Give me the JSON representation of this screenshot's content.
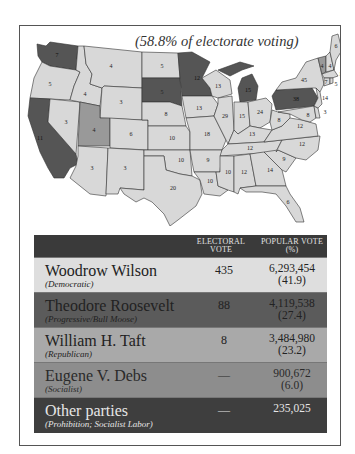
{
  "map": {
    "caption": "(58.8% of electorate voting)",
    "colors": {
      "wilson": "#d8d8d8",
      "roosevelt": "#555555",
      "taft": "#999999"
    },
    "states": [
      {
        "abbr": "WA",
        "ev": "7",
        "winner": "roosevelt"
      },
      {
        "abbr": "OR",
        "ev": "5",
        "winner": "wilson"
      },
      {
        "abbr": "CA",
        "ev": "11",
        "winner": "roosevelt"
      },
      {
        "abbr": "ID",
        "ev": "4",
        "winner": "wilson"
      },
      {
        "abbr": "NV",
        "ev": "3",
        "winner": "wilson"
      },
      {
        "abbr": "MT",
        "ev": "4",
        "winner": "wilson"
      },
      {
        "abbr": "WY",
        "ev": "3",
        "winner": "wilson"
      },
      {
        "abbr": "UT",
        "ev": "4",
        "winner": "taft"
      },
      {
        "abbr": "AZ",
        "ev": "3",
        "winner": "wilson"
      },
      {
        "abbr": "CO",
        "ev": "6",
        "winner": "wilson"
      },
      {
        "abbr": "NM",
        "ev": "3",
        "winner": "wilson"
      },
      {
        "abbr": "ND",
        "ev": "5",
        "winner": "wilson"
      },
      {
        "abbr": "SD",
        "ev": "5",
        "winner": "roosevelt"
      },
      {
        "abbr": "NE",
        "ev": "8",
        "winner": "wilson"
      },
      {
        "abbr": "KS",
        "ev": "10",
        "winner": "wilson"
      },
      {
        "abbr": "OK",
        "ev": "10",
        "winner": "wilson"
      },
      {
        "abbr": "TX",
        "ev": "20",
        "winner": "wilson"
      },
      {
        "abbr": "MN",
        "ev": "12",
        "winner": "roosevelt"
      },
      {
        "abbr": "IA",
        "ev": "13",
        "winner": "wilson"
      },
      {
        "abbr": "MO",
        "ev": "18",
        "winner": "wilson"
      },
      {
        "abbr": "AR",
        "ev": "9",
        "winner": "wilson"
      },
      {
        "abbr": "LA",
        "ev": "10",
        "winner": "wilson"
      },
      {
        "abbr": "WI",
        "ev": "13",
        "winner": "wilson"
      },
      {
        "abbr": "IL",
        "ev": "29",
        "winner": "wilson"
      },
      {
        "abbr": "MI",
        "ev": "15",
        "winner": "roosevelt"
      },
      {
        "abbr": "IN",
        "ev": "15",
        "winner": "wilson"
      },
      {
        "abbr": "OH",
        "ev": "24",
        "winner": "wilson"
      },
      {
        "abbr": "KY",
        "ev": "13",
        "winner": "wilson"
      },
      {
        "abbr": "TN",
        "ev": "12",
        "winner": "wilson"
      },
      {
        "abbr": "MS",
        "ev": "10",
        "winner": "wilson"
      },
      {
        "abbr": "AL",
        "ev": "12",
        "winner": "wilson"
      },
      {
        "abbr": "GA",
        "ev": "14",
        "winner": "wilson"
      },
      {
        "abbr": "FL",
        "ev": "6",
        "winner": "wilson"
      },
      {
        "abbr": "SC",
        "ev": "9",
        "winner": "wilson"
      },
      {
        "abbr": "NC",
        "ev": "12",
        "winner": "wilson"
      },
      {
        "abbr": "VA",
        "ev": "12",
        "winner": "wilson"
      },
      {
        "abbr": "WV",
        "ev": "8",
        "winner": "wilson"
      },
      {
        "abbr": "PA",
        "ev": "38",
        "winner": "roosevelt"
      },
      {
        "abbr": "NY",
        "ev": "45",
        "winner": "wilson"
      },
      {
        "abbr": "VT",
        "ev": "4",
        "winner": "taft"
      },
      {
        "abbr": "NH",
        "ev": "4",
        "winner": "wilson"
      },
      {
        "abbr": "ME",
        "ev": "6",
        "winner": "wilson"
      },
      {
        "abbr": "MA",
        "ev": "18",
        "winner": "wilson"
      },
      {
        "abbr": "RI",
        "ev": "5",
        "winner": "wilson"
      },
      {
        "abbr": "CT",
        "ev": "7",
        "winner": "wilson"
      },
      {
        "abbr": "NJ",
        "ev": "14",
        "winner": "wilson"
      },
      {
        "abbr": "DE",
        "ev": "3",
        "winner": "wilson"
      },
      {
        "abbr": "MD",
        "ev": "8",
        "winner": "wilson"
      }
    ]
  },
  "table": {
    "headers": {
      "electoral_1": "ELECTORAL",
      "electoral_2": "VOTE",
      "popular_1": "POPULAR VOTE",
      "popular_2": "(%)"
    },
    "rows": [
      {
        "name": "Woodrow Wilson",
        "party": "(Democratic)",
        "electoral": "435",
        "popular": "6,293,454",
        "percent": "(41.9)",
        "color": "#dedede"
      },
      {
        "name": "Theodore Roosevelt",
        "party": "(Progressive/Bull Moose)",
        "electoral": "88",
        "popular": "4,119,538",
        "percent": "(27.4)",
        "color": "#5b5b5b"
      },
      {
        "name": "William H. Taft",
        "party": "(Republican)",
        "electoral": "8",
        "popular": "3,484,980",
        "percent": "(23.2)",
        "color": "#a9a9a9"
      },
      {
        "name": "Eugene V. Debs",
        "party": "(Socialist)",
        "electoral": "—",
        "popular": "900,672",
        "percent": "(6.0)",
        "color": "#8d8d8d"
      },
      {
        "name": "Other parties",
        "party": "(Prohibition; Socialist Labor)",
        "electoral": "—",
        "popular": "235,025",
        "percent": "",
        "color": "#3e3e3e"
      }
    ]
  }
}
